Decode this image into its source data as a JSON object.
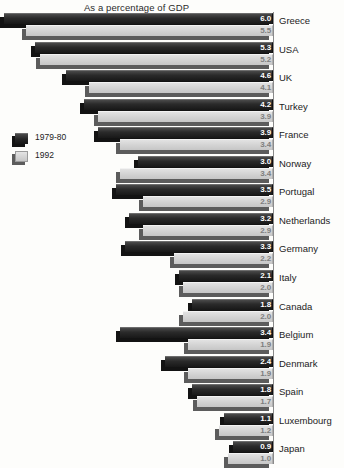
{
  "chart_data": {
    "type": "bar",
    "title": "As a percentage of GDP",
    "xlabel": "",
    "ylabel": "",
    "orientation": "horizontal",
    "xlim": [
      0,
      6.0
    ],
    "grid": false,
    "legend_position": "left-middle",
    "categories": [
      "Greece",
      "USA",
      "UK",
      "Turkey",
      "France",
      "Norway",
      "Portugal",
      "Netherlands",
      "Germany",
      "Italy",
      "Canada",
      "Belgium",
      "Denmark",
      "Spain",
      "Luxembourg",
      "Japan"
    ],
    "series": [
      {
        "name": "1979-80",
        "color": "#262626",
        "values": [
          6.0,
          5.3,
          4.6,
          4.2,
          3.9,
          3.0,
          3.5,
          3.2,
          3.3,
          2.1,
          1.8,
          3.4,
          2.4,
          1.8,
          1.1,
          0.9
        ]
      },
      {
        "name": "1992",
        "color": "#d2d2d2",
        "values": [
          5.5,
          5.2,
          4.1,
          3.9,
          3.4,
          3.4,
          2.9,
          2.9,
          2.2,
          2.0,
          2.0,
          1.9,
          1.9,
          1.7,
          1.2,
          1.0
        ]
      }
    ],
    "value_labels": {
      "1979-80": [
        "6.0",
        "5.3",
        "4.6",
        "4.2",
        "3.9",
        "3.0",
        "3.5",
        "3.2",
        "3.3",
        "2.1",
        "1.8",
        "3.4",
        "2.4",
        "1.8",
        "1.1",
        "0.9"
      ],
      "1992": [
        "5.5",
        "5.2",
        "4.1",
        "3.9",
        "3.4",
        "3.4",
        "2.9",
        "2.9",
        "2.2",
        "2.0",
        "2.0",
        "1.9",
        "1.9",
        "1.7",
        "1.2",
        "1.0"
      ]
    }
  },
  "legend": {
    "items": [
      {
        "label": "1979-80",
        "swatch": "dark"
      },
      {
        "label": "1992",
        "swatch": "light"
      }
    ]
  }
}
